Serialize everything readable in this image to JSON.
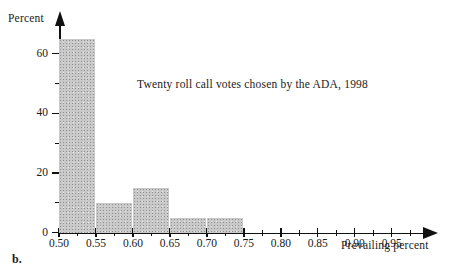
{
  "figure": {
    "panel_label": "b.",
    "annotation": "Twenty roll call votes chosen by the ADA, 1998"
  },
  "chart_data": {
    "type": "bar",
    "title": "",
    "subtitle": "",
    "annotations": [
      "Twenty roll call votes chosen by the ADA, 1998"
    ],
    "xlabel": "Prevailing percent",
    "ylabel": "Percent",
    "xlim": [
      0.5,
      0.995
    ],
    "ylim": [
      0,
      70
    ],
    "grid": false,
    "legend": null,
    "x_tick_labels": [
      "0.50",
      "0.55",
      "0.60",
      "0.65",
      "0.70",
      "0.75",
      "0.80",
      "0.85",
      "0.90",
      "0.95"
    ],
    "x_tick_values": [
      0.5,
      0.55,
      0.6,
      0.65,
      0.7,
      0.75,
      0.8,
      0.85,
      0.9,
      0.95
    ],
    "x_minor_step": 0.025,
    "y_tick_labels": [
      "0",
      "20",
      "40",
      "60"
    ],
    "y_tick_values": [
      0,
      20,
      40,
      60
    ],
    "y_minor_values": [
      10,
      30,
      50
    ],
    "bin_width": 0.05,
    "categories": [
      "0.50-0.55",
      "0.55-0.60",
      "0.60-0.65",
      "0.65-0.70",
      "0.70-0.75"
    ],
    "bin_edges": [
      0.5,
      0.55,
      0.6,
      0.65,
      0.7,
      0.75
    ],
    "values": [
      65,
      10,
      15,
      5,
      5
    ],
    "bar_color": "#c9c9c9"
  }
}
